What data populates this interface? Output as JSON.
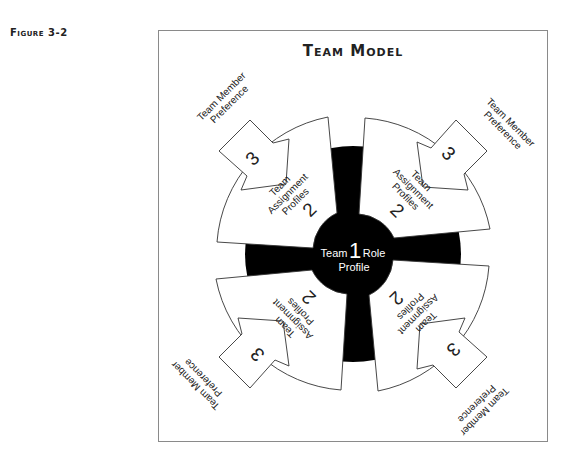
{
  "figure_label": "Figure 3-2",
  "title": "Team Model",
  "center": {
    "number": "1",
    "label_left": "Team",
    "label_right": "Role",
    "label_bottom": "Profile"
  },
  "quadrants": [
    {
      "position": "top-left",
      "assignment": {
        "number": "2",
        "lines": [
          "Team",
          "Assignment",
          "Profiles"
        ]
      },
      "preference": {
        "number": "3",
        "lines": [
          "Team Member",
          "Preference"
        ]
      }
    },
    {
      "position": "top-right",
      "assignment": {
        "number": "2",
        "lines": [
          "Team",
          "Assignment",
          "Profiles"
        ]
      },
      "preference": {
        "number": "3",
        "lines": [
          "Team Member",
          "Preference"
        ]
      }
    },
    {
      "position": "bottom-right",
      "assignment": {
        "number": "2",
        "lines": [
          "Team",
          "Assignment",
          "Profiles"
        ]
      },
      "preference": {
        "number": "3",
        "lines": [
          "Team Member",
          "Preference"
        ]
      }
    },
    {
      "position": "bottom-left",
      "assignment": {
        "number": "2",
        "lines": [
          "Team",
          "Assignment",
          "Profiles"
        ]
      },
      "preference": {
        "number": "3",
        "lines": [
          "Team Member",
          "Preference"
        ]
      }
    }
  ],
  "colors": {
    "core": "#000000",
    "wedge": "#ffffff",
    "outline": "#333333",
    "frame": "#8a8a8a"
  }
}
